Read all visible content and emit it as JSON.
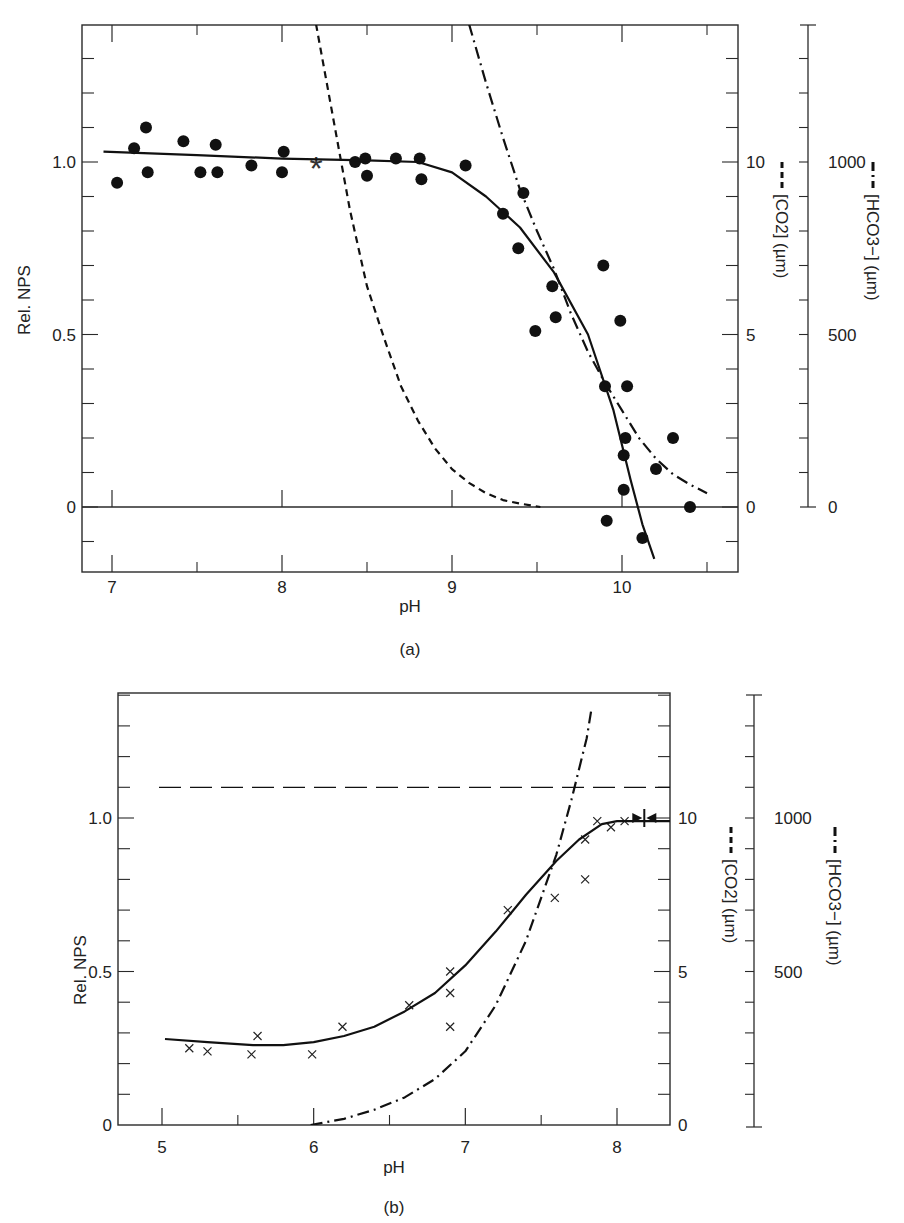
{
  "figure": {
    "panels": [
      "(a)",
      "(b)"
    ]
  },
  "chart_data": [
    {
      "type": "scatter",
      "panel_label": "(a)",
      "title": "",
      "xlabel": "pH",
      "ylabel": "Rel. NPS",
      "y2label": "[CO2] (µm)",
      "y3label": "[HCO3−] (µm)",
      "x_ticks": [
        7,
        8,
        9,
        10
      ],
      "x_minor_ticks": [
        7.5,
        8.5,
        9.5,
        10.5
      ],
      "y_ticks": [
        0,
        0.5,
        1.0
      ],
      "y_tick_labels": [
        "0",
        "0.5",
        "1.0"
      ],
      "y2_ticks": [
        0,
        5,
        10
      ],
      "y3_ticks": [
        0,
        500,
        1000
      ],
      "xlim": [
        6.82,
        10.68
      ],
      "ylim": [
        -0.19,
        1.4
      ],
      "y2lim": [
        -1.9,
        14
      ],
      "y3lim": [
        0,
        1400
      ],
      "grid": false,
      "series": [
        {
          "name": "Rel. NPS measured",
          "marker": "filled-circle",
          "points": [
            [
              7.03,
              0.94
            ],
            [
              7.13,
              1.04
            ],
            [
              7.2,
              1.1
            ],
            [
              7.21,
              0.97
            ],
            [
              7.42,
              1.06
            ],
            [
              7.52,
              0.97
            ],
            [
              7.61,
              1.05
            ],
            [
              7.62,
              0.97
            ],
            [
              7.82,
              0.99
            ],
            [
              8.0,
              0.97
            ],
            [
              8.01,
              1.03
            ],
            [
              8.43,
              1.0
            ],
            [
              8.49,
              1.01
            ],
            [
              8.5,
              0.96
            ],
            [
              8.67,
              1.01
            ],
            [
              8.81,
              1.01
            ],
            [
              8.82,
              0.95
            ],
            [
              9.08,
              0.99
            ],
            [
              9.3,
              0.85
            ],
            [
              9.39,
              0.75
            ],
            [
              9.42,
              0.91
            ],
            [
              9.49,
              0.51
            ],
            [
              9.59,
              0.64
            ],
            [
              9.61,
              0.55
            ],
            [
              9.89,
              0.7
            ],
            [
              9.9,
              0.35
            ],
            [
              9.91,
              -0.04
            ],
            [
              9.99,
              0.54
            ],
            [
              10.01,
              0.15
            ],
            [
              10.01,
              0.05
            ],
            [
              10.02,
              0.2
            ],
            [
              10.03,
              0.35
            ],
            [
              10.12,
              -0.09
            ],
            [
              10.2,
              0.11
            ],
            [
              10.3,
              0.2
            ],
            [
              10.4,
              0.0
            ]
          ]
        },
        {
          "name": "Compensation point",
          "marker": "asterisk",
          "points": [
            [
              8.2,
              0.99
            ]
          ]
        },
        {
          "name": "Rel. NPS fit",
          "style": "solid",
          "points": [
            [
              6.95,
              1.03
            ],
            [
              7.5,
              1.02
            ],
            [
              8.0,
              1.01
            ],
            [
              8.5,
              1.005
            ],
            [
              8.8,
              1.0
            ],
            [
              9.0,
              0.97
            ],
            [
              9.2,
              0.9
            ],
            [
              9.4,
              0.81
            ],
            [
              9.6,
              0.68
            ],
            [
              9.8,
              0.5
            ],
            [
              9.95,
              0.28
            ],
            [
              10.05,
              0.08
            ],
            [
              10.12,
              -0.05
            ],
            [
              10.19,
              -0.15
            ]
          ]
        },
        {
          "name": "[CO2] (µm)",
          "style": "dashed",
          "axis": "y2",
          "points": [
            [
              8.2,
              14.0
            ],
            [
              8.3,
              11.3
            ],
            [
              8.4,
              8.6
            ],
            [
              8.5,
              6.4
            ],
            [
              8.6,
              4.9
            ],
            [
              8.7,
              3.5
            ],
            [
              8.8,
              2.5
            ],
            [
              8.9,
              1.7
            ],
            [
              9.0,
              1.1
            ],
            [
              9.1,
              0.7
            ],
            [
              9.2,
              0.4
            ],
            [
              9.3,
              0.2
            ],
            [
              9.4,
              0.1
            ],
            [
              9.52,
              0.0
            ]
          ]
        },
        {
          "name": "[HCO3−] (µm)",
          "style": "dash-dot",
          "axis": "y3",
          "points": [
            [
              9.1,
              1400
            ],
            [
              9.2,
              1230
            ],
            [
              9.3,
              1070
            ],
            [
              9.4,
              920
            ],
            [
              9.5,
              800
            ],
            [
              9.6,
              690
            ],
            [
              9.7,
              560
            ],
            [
              9.8,
              450
            ],
            [
              9.9,
              360
            ],
            [
              10.0,
              280
            ],
            [
              10.1,
              200
            ],
            [
              10.2,
              140
            ],
            [
              10.3,
              95
            ],
            [
              10.4,
              65
            ],
            [
              10.5,
              40
            ]
          ]
        }
      ]
    },
    {
      "type": "scatter",
      "panel_label": "(b)",
      "title": "",
      "xlabel": "pH",
      "ylabel": "Rel. NPS",
      "y2label": "[CO2] (µm)",
      "y3label": "[HCO3−] (µm)",
      "x_ticks": [
        5,
        6,
        7,
        8
      ],
      "x_minor_ticks": [
        5.5,
        6.5,
        7.5
      ],
      "y_ticks": [
        0,
        0.5,
        1.0
      ],
      "y_tick_labels": [
        "0",
        "0.5",
        "1.0"
      ],
      "y2_ticks": [
        0,
        5,
        10
      ],
      "y3_ticks": [
        500,
        1000
      ],
      "xlim": [
        4.8,
        8.45
      ],
      "ylim": [
        0,
        1.4
      ],
      "y2lim": [
        0,
        14
      ],
      "y3lim": [
        0,
        1400
      ],
      "grid": false,
      "series": [
        {
          "name": "Rel. NPS measured",
          "marker": "x",
          "points": [
            [
              5.18,
              0.25
            ],
            [
              5.3,
              0.24
            ],
            [
              5.59,
              0.23
            ],
            [
              5.63,
              0.29
            ],
            [
              5.99,
              0.23
            ],
            [
              6.19,
              0.32
            ],
            [
              6.63,
              0.39
            ],
            [
              6.9,
              0.5
            ],
            [
              6.9,
              0.43
            ],
            [
              6.9,
              0.32
            ],
            [
              7.28,
              0.7
            ],
            [
              7.59,
              0.74
            ],
            [
              7.79,
              0.8
            ],
            [
              7.79,
              0.93
            ],
            [
              7.87,
              0.99
            ],
            [
              7.96,
              0.97
            ],
            [
              8.05,
              0.99
            ]
          ]
        },
        {
          "name": "Compensation point marker",
          "marker": "arrows-bar",
          "points": [
            [
              8.18,
              1.0
            ]
          ]
        },
        {
          "name": "Rel. NPS fit",
          "style": "solid",
          "points": [
            [
              5.02,
              0.28
            ],
            [
              5.3,
              0.27
            ],
            [
              5.6,
              0.26
            ],
            [
              5.8,
              0.26
            ],
            [
              6.0,
              0.27
            ],
            [
              6.2,
              0.29
            ],
            [
              6.4,
              0.32
            ],
            [
              6.6,
              0.37
            ],
            [
              6.8,
              0.43
            ],
            [
              7.0,
              0.52
            ],
            [
              7.2,
              0.63
            ],
            [
              7.4,
              0.75
            ],
            [
              7.6,
              0.86
            ],
            [
              7.75,
              0.93
            ],
            [
              7.9,
              0.98
            ],
            [
              8.0,
              0.99
            ],
            [
              8.45,
              0.99
            ]
          ]
        },
        {
          "name": "[CO2] (µm)",
          "style": "long-dashed",
          "axis": "y2",
          "points": [
            [
              4.98,
              11.0
            ],
            [
              8.45,
              11.0
            ]
          ]
        },
        {
          "name": "[HCO3−] (µm)",
          "style": "dash-dot",
          "axis": "y3",
          "points": [
            [
              5.98,
              0
            ],
            [
              6.2,
              20
            ],
            [
              6.4,
              50
            ],
            [
              6.6,
              90
            ],
            [
              6.8,
              150
            ],
            [
              7.0,
              240
            ],
            [
              7.2,
              390
            ],
            [
              7.4,
              600
            ],
            [
              7.6,
              880
            ],
            [
              7.7,
              1060
            ],
            [
              7.8,
              1260
            ],
            [
              7.83,
              1350
            ]
          ]
        }
      ]
    }
  ]
}
